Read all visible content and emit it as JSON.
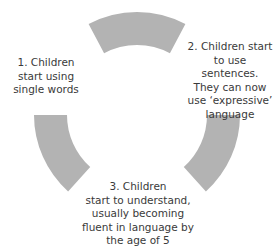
{
  "diagram": {
    "type": "cycle",
    "arc_color": "#b3b3b3",
    "text_color": "#3a3a3a",
    "stages": [
      {
        "number": 1,
        "label": "1. Children\nstart using\nsingle words"
      },
      {
        "number": 2,
        "label": "2. Children start\nto use sentences.\nThey can now\nuse ‘expressive’\nlanguage"
      },
      {
        "number": 3,
        "label": "3. Children\nstart to understand,\nusually becoming\nfluent in language by\nthe age of 5"
      }
    ]
  }
}
